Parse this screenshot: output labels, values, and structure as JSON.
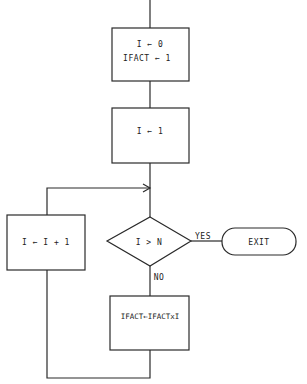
{
  "flowchart": {
    "nodes": {
      "init": {
        "line1": "I ← 0",
        "line2": "IFACT ← 1"
      },
      "set_i": {
        "label": "I ← 1"
      },
      "increment": {
        "label": "I ← I + 1"
      },
      "decision": {
        "label": "I > N"
      },
      "compute": {
        "label": "IFACT←IFACTxI"
      },
      "exit": {
        "label": "EXIT"
      }
    },
    "edges": {
      "yes_label": "YES",
      "no_label": "NO"
    },
    "colors": {
      "line": "#2a2a2a",
      "background": "#ffffff"
    }
  }
}
